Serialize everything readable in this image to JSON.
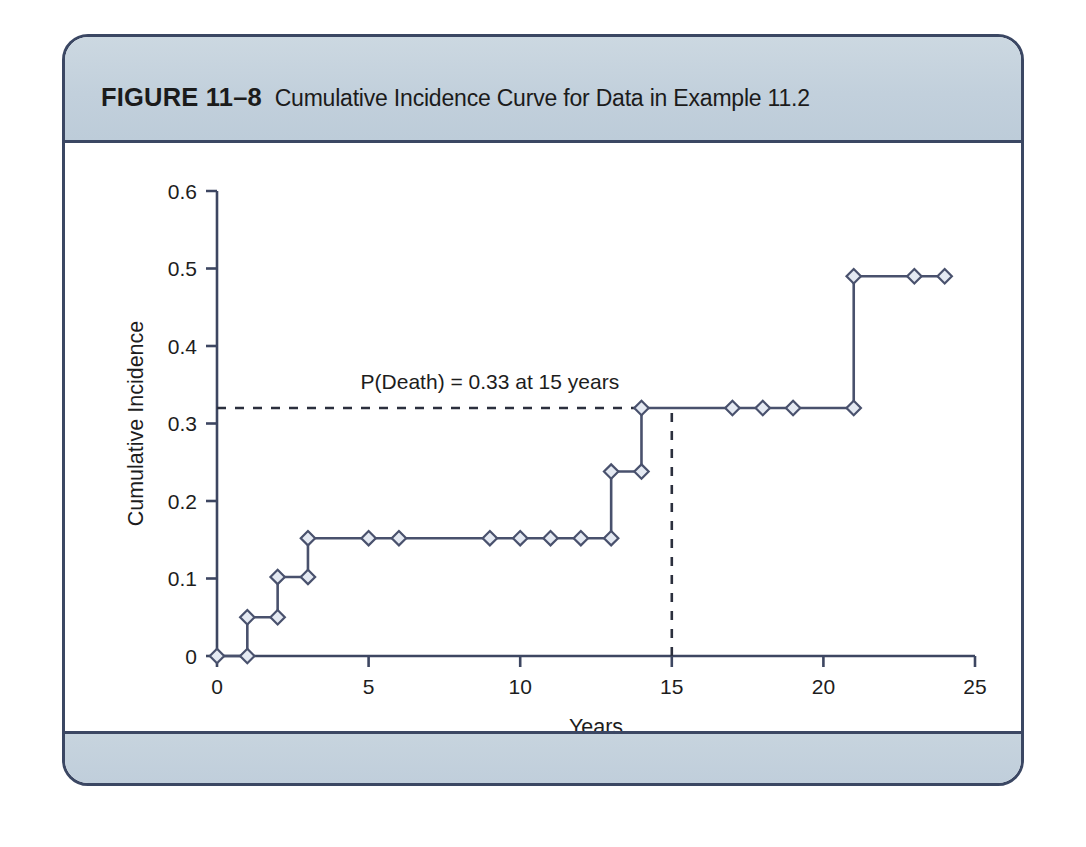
{
  "figure": {
    "number": "FIGURE 11–8",
    "caption": "Cumulative Incidence Curve for Data in Example 11.2"
  },
  "colors": {
    "header_bg": "#c5d3dd",
    "frame_border": "#3b4763",
    "curve": "#49516d",
    "marker_fill": "#e4e9f2",
    "guide_dash": "#2b2f3d",
    "plot_bg": "#ffffff"
  },
  "chart_data": {
    "type": "line",
    "title": "Cumulative Incidence Curve for Data in Example 11.2",
    "xlabel": "Years",
    "ylabel": "Cumulative Incidence",
    "xlim": [
      0,
      25
    ],
    "ylim": [
      0,
      0.6
    ],
    "xticks": [
      0,
      5,
      10,
      15,
      20,
      25
    ],
    "xtick_labels": [
      "0",
      "5",
      "10",
      "15",
      "20",
      "25"
    ],
    "yticks": [
      0,
      0.1,
      0.2,
      0.3,
      0.4,
      0.5,
      0.6
    ],
    "ytick_labels": [
      "0",
      "0.1",
      "0.2",
      "0.3",
      "0.4",
      "0.5",
      "0.6"
    ],
    "grid": false,
    "legend": null,
    "series": [
      {
        "name": "Cumulative incidence (step function)",
        "style": "step-post",
        "marker": "diamond-open",
        "step_points": [
          [
            0,
            0
          ],
          [
            1,
            0
          ],
          [
            1,
            0.05
          ],
          [
            2,
            0.05
          ],
          [
            2,
            0.102
          ],
          [
            3,
            0.102
          ],
          [
            3,
            0.152
          ],
          [
            5,
            0.152
          ],
          [
            6,
            0.152
          ],
          [
            9,
            0.152
          ],
          [
            10,
            0.152
          ],
          [
            11,
            0.152
          ],
          [
            12,
            0.152
          ],
          [
            13,
            0.152
          ],
          [
            13,
            0.238
          ],
          [
            14,
            0.238
          ],
          [
            14,
            0.32
          ],
          [
            17,
            0.32
          ],
          [
            18,
            0.32
          ],
          [
            19,
            0.32
          ],
          [
            21,
            0.32
          ],
          [
            21,
            0.49
          ],
          [
            23,
            0.49
          ],
          [
            24,
            0.49
          ]
        ],
        "markers": [
          [
            0,
            0
          ],
          [
            1,
            0
          ],
          [
            1,
            0.05
          ],
          [
            2,
            0.05
          ],
          [
            2,
            0.102
          ],
          [
            3,
            0.102
          ],
          [
            3,
            0.152
          ],
          [
            5,
            0.152
          ],
          [
            6,
            0.152
          ],
          [
            9,
            0.152
          ],
          [
            10,
            0.152
          ],
          [
            11,
            0.152
          ],
          [
            12,
            0.152
          ],
          [
            13,
            0.152
          ],
          [
            13,
            0.238
          ],
          [
            14,
            0.238
          ],
          [
            14,
            0.32
          ],
          [
            17,
            0.32
          ],
          [
            18,
            0.32
          ],
          [
            19,
            0.32
          ],
          [
            21,
            0.32
          ],
          [
            21,
            0.49
          ],
          [
            23,
            0.49
          ],
          [
            24,
            0.49
          ]
        ]
      }
    ],
    "annotations": [
      {
        "text": "P(Death) = 0.33 at 15 years",
        "x": 9.0,
        "y": 0.345,
        "anchor": "middle"
      }
    ],
    "reference_lines": [
      {
        "name": "horizontal-probability-guide",
        "orientation": "horizontal",
        "value": 0.32,
        "from": 0,
        "to": 14,
        "style": "dashed"
      },
      {
        "name": "vertical-15-year-guide",
        "orientation": "vertical",
        "value": 15,
        "from": 0,
        "to": 0.32,
        "style": "dashed"
      }
    ]
  }
}
